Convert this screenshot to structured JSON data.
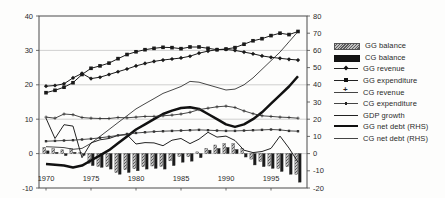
{
  "figure": {
    "background": "#fdfdfc",
    "text_color": "#2a2a2a",
    "grid_color": "#bdbdbd",
    "frame_color": "#4a4a4a"
  },
  "chart_data": {
    "type": "combo-bar-line",
    "title": "",
    "xlabel": "",
    "ylabel_left": "",
    "ylabel_right": "",
    "grid": "horizontal",
    "legend_position": "right",
    "x": [
      1970,
      1971,
      1972,
      1973,
      1974,
      1975,
      1976,
      1977,
      1978,
      1979,
      1980,
      1981,
      1982,
      1983,
      1984,
      1985,
      1986,
      1987,
      1988,
      1989,
      1990,
      1991,
      1992,
      1993,
      1994,
      1995,
      1996,
      1997,
      1998
    ],
    "x_tick_labels": [
      "1970",
      "1975",
      "1980",
      "1985",
      "1990",
      "1995"
    ],
    "x_tick_values": [
      1970,
      1975,
      1980,
      1985,
      1990,
      1995
    ],
    "left_axis": {
      "min": -10,
      "max": 40,
      "tick_step": 10,
      "labels": [
        "40",
        "30",
        "20",
        "10",
        "0",
        "-10"
      ]
    },
    "right_axis": {
      "min": -20,
      "max": 80,
      "tick_step": 10,
      "labels": [
        "80",
        "70",
        "60",
        "50",
        "40",
        "30",
        "20",
        "10",
        "0",
        "-10",
        "-20"
      ]
    },
    "gridline_values_left": [
      30,
      20,
      10,
      0
    ],
    "series": [
      {
        "name": "GG balance",
        "type": "bar",
        "axis": "left",
        "pattern": "hatched",
        "color": "#8c8c8c",
        "values": [
          1.8,
          1.4,
          1.1,
          1.5,
          0.4,
          -2.8,
          -3.7,
          -3.8,
          -5.5,
          -4.7,
          -4.4,
          -3.8,
          -3.6,
          -3.7,
          -2.1,
          -0.8,
          -0.9,
          0.5,
          1.5,
          2.5,
          2.9,
          2.9,
          1.5,
          -1.6,
          -2.3,
          -3.6,
          -4.3,
          -3.8,
          -6.0
        ]
      },
      {
        "name": "CG balance",
        "type": "bar",
        "axis": "left",
        "pattern": "solid",
        "color": "#1a1a1a",
        "values": [
          0.8,
          0.4,
          -0.6,
          0.4,
          -0.5,
          -3.5,
          -4.0,
          -4.5,
          -6.0,
          -5.5,
          -5.0,
          -4.5,
          -4.3,
          -4.5,
          -3.5,
          -2.5,
          -2.2,
          -1.2,
          1.0,
          1.5,
          1.8,
          1.2,
          -1.0,
          -3.3,
          -3.8,
          -4.3,
          -5.2,
          -6.0,
          -8.3
        ]
      },
      {
        "name": "GG revenue",
        "type": "line",
        "axis": "left",
        "marker": "diamond",
        "weight": "regular",
        "color": "#1a1a1a",
        "values": [
          19.6,
          19.8,
          20.3,
          22.0,
          23.3,
          21.8,
          22.2,
          23.0,
          23.8,
          24.6,
          25.5,
          26.2,
          26.8,
          27.2,
          27.5,
          27.8,
          28.3,
          29.2,
          29.8,
          30.2,
          30.3,
          30.0,
          29.5,
          29.0,
          28.4,
          28.0,
          27.7,
          27.4,
          27.2
        ]
      },
      {
        "name": "GG expenditure",
        "type": "line",
        "axis": "left",
        "marker": "square",
        "weight": "regular",
        "color": "#1a1a1a",
        "values": [
          17.7,
          18.4,
          19.3,
          20.6,
          23.0,
          24.8,
          25.5,
          26.3,
          27.6,
          28.8,
          29.6,
          30.2,
          30.6,
          30.9,
          30.8,
          30.5,
          31.0,
          31.0,
          30.6,
          30.2,
          30.4,
          30.8,
          31.8,
          32.8,
          33.4,
          34.3,
          35.0,
          34.6,
          35.5
        ]
      },
      {
        "name": "CG revenue",
        "type": "line",
        "axis": "left",
        "marker": "plus",
        "weight": "thin",
        "color": "#333333",
        "values": [
          10.6,
          10.3,
          11.5,
          11.3,
          10.5,
          10.3,
          10.2,
          10.2,
          10.5,
          10.4,
          10.6,
          10.8,
          10.8,
          11.0,
          11.2,
          11.5,
          12.0,
          12.8,
          13.2,
          13.6,
          13.8,
          13.4,
          12.4,
          11.6,
          11.0,
          10.8,
          10.6,
          10.5,
          10.3
        ]
      },
      {
        "name": "CG expenditure",
        "type": "line",
        "axis": "left",
        "marker": "small-square",
        "weight": "thin",
        "color": "#333333",
        "values": [
          3.6,
          3.7,
          3.8,
          3.9,
          4.1,
          4.3,
          4.6,
          4.9,
          5.3,
          5.7,
          6.0,
          6.2,
          6.4,
          6.5,
          6.6,
          6.7,
          6.8,
          6.9,
          6.8,
          6.7,
          6.6,
          6.6,
          6.7,
          6.8,
          6.9,
          7.0,
          6.9,
          6.6,
          6.5
        ]
      },
      {
        "name": "GDP growth",
        "type": "line",
        "axis": "left",
        "marker": null,
        "weight": "regular",
        "color": "#222222",
        "values": [
          10.3,
          4.4,
          8.4,
          8.0,
          -1.2,
          3.1,
          4.0,
          4.4,
          5.3,
          5.5,
          2.8,
          3.2,
          3.1,
          2.3,
          3.9,
          4.4,
          2.9,
          4.2,
          6.2,
          4.8,
          5.1,
          3.8,
          1.0,
          0.3,
          0.6,
          1.5,
          5.1,
          1.6,
          -2.5
        ]
      },
      {
        "name": "GG net debt (RHS)",
        "type": "line",
        "axis": "right",
        "marker": null,
        "weight": "thick",
        "color": "#111111",
        "values": [
          -6,
          -6.5,
          -7,
          -8,
          -7,
          -4,
          -1,
          2,
          6,
          10,
          14,
          17,
          20,
          23,
          25,
          26.5,
          27,
          26,
          23,
          20,
          17,
          15.5,
          17,
          20,
          24,
          29,
          34,
          39,
          45
        ]
      },
      {
        "name": "CG net debt (RHS)",
        "type": "line",
        "axis": "right",
        "marker": null,
        "weight": "thin",
        "color": "#333333",
        "values": [
          4,
          3.8,
          3.5,
          2.5,
          3,
          6,
          10,
          14,
          18,
          22,
          26,
          29,
          32,
          35,
          37,
          39,
          42,
          41.5,
          40,
          38.5,
          37,
          37.5,
          40,
          44,
          49,
          54,
          59,
          65,
          71
        ]
      }
    ]
  }
}
